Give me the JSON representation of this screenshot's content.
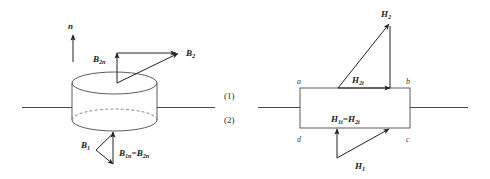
{
  "figure": {
    "regions": {
      "upper_label": "(1)",
      "lower_label": "(2)"
    },
    "left_diagram": {
      "name": "pillbox-cylinder-normal-B",
      "normal_label": "n",
      "vectors": [
        {
          "id": "B2",
          "label_main": "B",
          "label_sub": "2"
        },
        {
          "id": "B2n",
          "label_main": "B",
          "label_sub": "2n"
        },
        {
          "id": "B1",
          "label_main": "B",
          "label_sub": "1"
        },
        {
          "id": "B1n_eq_B2n",
          "label_main": "B",
          "label_sub": "1n",
          "equals": "=",
          "label_main2": "B",
          "label_sub2": "2n"
        }
      ]
    },
    "right_diagram": {
      "name": "amperian-loop-tangential-H",
      "corner_labels": {
        "top_left": "a",
        "top_right": "b",
        "bottom_right": "c",
        "bottom_left": "d"
      },
      "vectors": [
        {
          "id": "H2",
          "label_main": "H",
          "label_sub": "2"
        },
        {
          "id": "H2t",
          "label_main": "H",
          "label_sub": "2t"
        },
        {
          "id": "H1",
          "label_main": "H",
          "label_sub": "1"
        },
        {
          "id": "H1t_eq_H2t",
          "label_main": "H",
          "label_sub": "1t",
          "equals": "=",
          "label_main2": "H",
          "label_sub2": "2t"
        }
      ]
    },
    "colors": {
      "background": "#ffffff",
      "interface_line": "#4a4a4a",
      "shape_stroke": "#4a4a4a",
      "dashed_stroke": "#6a6a6a",
      "arrow_stroke": "#222222",
      "label_text": "#1a1a1a"
    }
  }
}
